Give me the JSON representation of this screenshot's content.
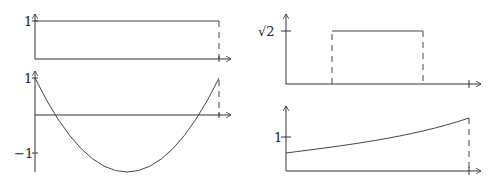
{
  "diagram": {
    "panels": [
      {
        "id": "top-left",
        "description": "constant function equal to 1 on an interval",
        "y_tick_labels": [
          "1"
        ],
        "shape": "rectangle-step"
      },
      {
        "id": "bottom-left",
        "description": "parabola starting and ending at 1, dipping below -1",
        "y_tick_labels": [
          "1",
          "−1"
        ],
        "shape": "parabola"
      },
      {
        "id": "top-right",
        "description": "rectangular pulse of height sqrt(2) on a sub-interval",
        "y_tick_labels": [
          "√2"
        ],
        "shape": "rectangular-pulse"
      },
      {
        "id": "bottom-right",
        "description": "increasing convex curve crossing level 1",
        "y_tick_labels": [
          "1"
        ],
        "shape": "exponential-like"
      }
    ]
  },
  "labels": {
    "tl_one": "1",
    "bl_one": "1",
    "bl_minus_one": "−1",
    "tr_sqrt2": "√2",
    "br_one": "1"
  }
}
